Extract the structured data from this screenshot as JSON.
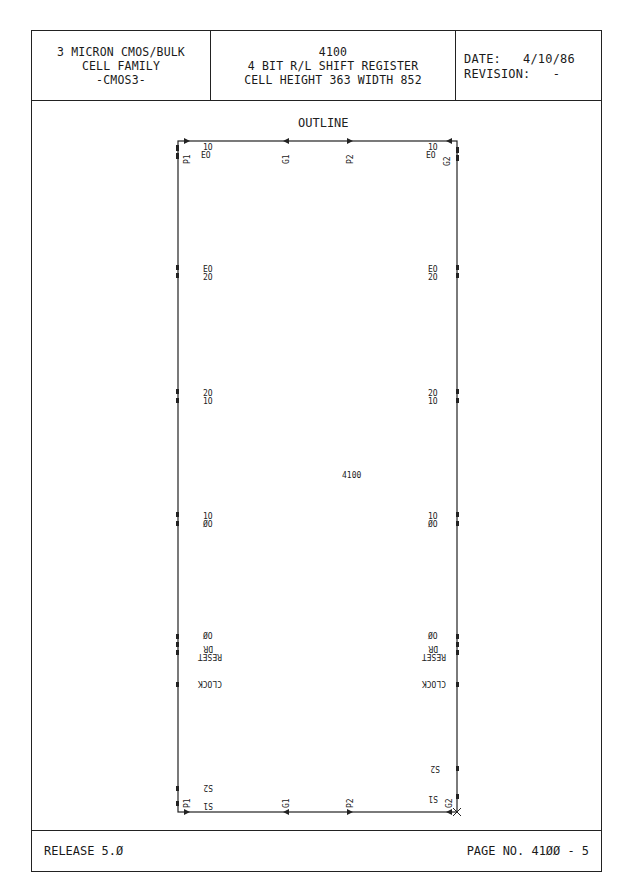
{
  "header": {
    "left": [
      "3 MICRON CMOS/BULK",
      "CELL FAMILY",
      "-CMOS3-"
    ],
    "center": [
      "4100",
      "4 BIT R/L SHIFT REGISTER",
      "CELL HEIGHT 363 WIDTH 852"
    ],
    "right": {
      "date_label": "DATE:",
      "date_value": "4/10/86",
      "revision_label": "REVISION:",
      "revision_value": "-"
    }
  },
  "drawing": {
    "title": "OUTLINE",
    "cell_label": "4100",
    "top_pins": [
      "P1",
      "G1",
      "P2",
      "G2"
    ],
    "bottom_pins": [
      "P1",
      "G1",
      "P2",
      "G2"
    ],
    "top_signals": {
      "left": "EO",
      "left_sup": "1O",
      "right": "EO",
      "right_sup": "1O"
    },
    "left_side_labels": [
      {
        "lines": [
          "EO",
          "2O"
        ]
      },
      {
        "lines": [
          "2O",
          "1O"
        ]
      },
      {
        "lines": [
          "1O",
          "ØO"
        ]
      },
      {
        "lines": [
          "ØO",
          "DR",
          "RESET"
        ]
      },
      {
        "lines": [
          "CLOCK"
        ]
      },
      {
        "lines": [
          "S2"
        ]
      },
      {
        "lines": [
          "S1"
        ]
      }
    ],
    "right_side_labels": [
      {
        "lines": [
          "EO",
          "2O"
        ]
      },
      {
        "lines": [
          "2O",
          "1O"
        ]
      },
      {
        "lines": [
          "1O",
          "ØO"
        ]
      },
      {
        "lines": [
          "ØO",
          "DR",
          "RESET"
        ]
      },
      {
        "lines": [
          "CLOCK"
        ]
      },
      {
        "lines": [
          "S2"
        ]
      },
      {
        "lines": [
          "S1"
        ]
      }
    ]
  },
  "footer": {
    "release": "RELEASE 5.Ø",
    "page": "PAGE NO. 41ØØ - 5"
  }
}
